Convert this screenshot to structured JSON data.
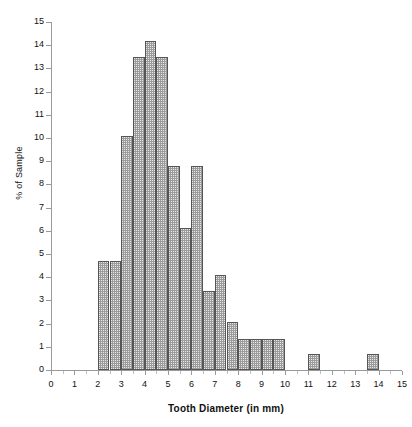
{
  "chart_data": {
    "type": "bar",
    "title": "",
    "subtitle": "",
    "xlabel": "Tooth Diameter (in mm)",
    "ylabel": "% of Sample",
    "xlim": [
      0,
      15
    ],
    "ylim": [
      0,
      15
    ],
    "grid": false,
    "legend": "none",
    "bin_width": 0.5,
    "x_tick_labels": [
      "0",
      "1",
      "2",
      "3",
      "4",
      "5",
      "6",
      "7",
      "8",
      "9",
      "10",
      "11",
      "12",
      "13",
      "14",
      "15"
    ],
    "x_ticks": [
      0,
      1,
      2,
      3,
      4,
      5,
      6,
      7,
      8,
      9,
      10,
      11,
      12,
      13,
      14,
      15
    ],
    "y_tick_labels": [
      "0",
      "1",
      "2",
      "3",
      "4",
      "5",
      "6",
      "7",
      "8",
      "9",
      "10",
      "11",
      "12",
      "13",
      "14",
      "15"
    ],
    "y_ticks": [
      0,
      1,
      2,
      3,
      4,
      5,
      6,
      7,
      8,
      9,
      10,
      11,
      12,
      13,
      14,
      15
    ],
    "bins": [
      {
        "start": 2.0,
        "end": 2.5,
        "value": 4.7
      },
      {
        "start": 2.5,
        "end": 3.0,
        "value": 4.7
      },
      {
        "start": 3.0,
        "end": 3.5,
        "value": 10.1
      },
      {
        "start": 3.5,
        "end": 4.0,
        "value": 13.5
      },
      {
        "start": 4.0,
        "end": 4.5,
        "value": 14.2
      },
      {
        "start": 4.5,
        "end": 5.0,
        "value": 13.5
      },
      {
        "start": 5.0,
        "end": 5.5,
        "value": 8.8
      },
      {
        "start": 5.5,
        "end": 6.0,
        "value": 6.1
      },
      {
        "start": 6.0,
        "end": 6.5,
        "value": 8.8
      },
      {
        "start": 6.5,
        "end": 7.0,
        "value": 3.4
      },
      {
        "start": 7.0,
        "end": 7.5,
        "value": 4.1
      },
      {
        "start": 7.5,
        "end": 8.0,
        "value": 2.05
      },
      {
        "start": 8.0,
        "end": 8.5,
        "value": 1.35
      },
      {
        "start": 8.5,
        "end": 9.0,
        "value": 1.35
      },
      {
        "start": 9.0,
        "end": 9.5,
        "value": 1.35
      },
      {
        "start": 9.5,
        "end": 10.0,
        "value": 1.35
      },
      {
        "start": 11.0,
        "end": 11.5,
        "value": 0.7
      },
      {
        "start": 13.5,
        "end": 14.0,
        "value": 0.7
      }
    ],
    "categories": [
      "2.0-2.5",
      "2.5-3.0",
      "3.0-3.5",
      "3.5-4.0",
      "4.0-4.5",
      "4.5-5.0",
      "5.0-5.5",
      "5.5-6.0",
      "6.0-6.5",
      "6.5-7.0",
      "7.0-7.5",
      "7.5-8.0",
      "8.0-8.5",
      "8.5-9.0",
      "9.0-9.5",
      "9.5-10.0",
      "11.0-11.5",
      "13.5-14.0"
    ],
    "values": [
      4.7,
      4.7,
      10.1,
      13.5,
      14.2,
      13.5,
      8.8,
      6.1,
      8.8,
      3.4,
      4.1,
      2.05,
      1.35,
      1.35,
      1.35,
      1.35,
      0.7,
      0.7
    ],
    "colors": {
      "bar_fill": "#e9e9e9",
      "bar_hatch": "#9b9b9b",
      "bar_border": "#555555",
      "axis": "#9a9a9a",
      "text": "#111111",
      "background": "#ffffff"
    }
  }
}
